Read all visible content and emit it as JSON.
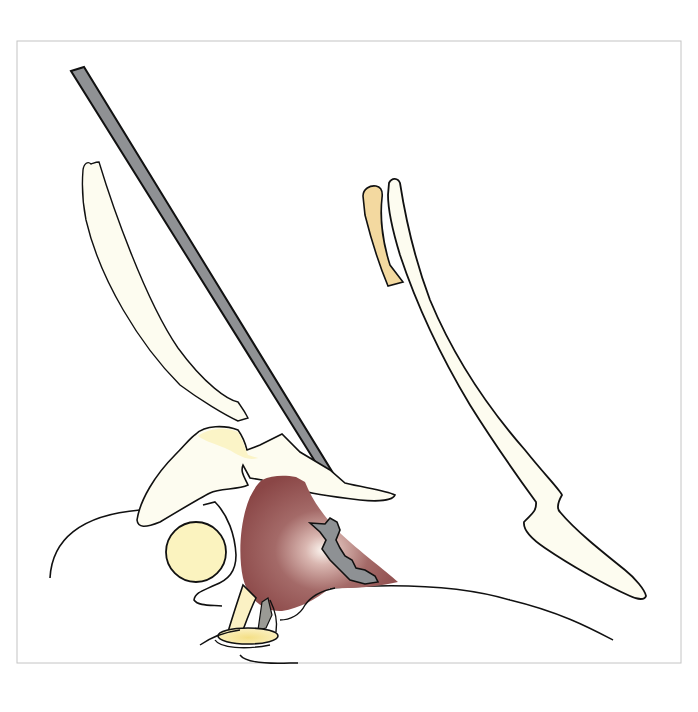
{
  "figure": {
    "type": "medical-illustration",
    "frame": {
      "x": 17,
      "y": 41,
      "width": 664,
      "height": 622,
      "stroke": "#bdbdbd"
    },
    "colors": {
      "outline": "#111111",
      "bone_fill": "#fdfcf0",
      "bone_yellow": "#fbf3c2",
      "cartilage_tan": "#f3d9a0",
      "needle_gray": "#8f9194",
      "mass_dark": "#8c4a4a",
      "mass_mid": "#a46a68",
      "mass_highlight": "#fbf4ee",
      "gray_region": "#8e9194",
      "circle_fill": "#fbf3bf",
      "pituitary_yellow": "#f6e49a"
    },
    "elements": [
      {
        "id": "needle",
        "label": "instrument-shaft"
      },
      {
        "id": "left-bone",
        "label": "anterior-bone-plate"
      },
      {
        "id": "right-bone",
        "label": "posterior-bone-strip"
      },
      {
        "id": "tan-strip",
        "label": "cartilage-strip"
      },
      {
        "id": "sphenoid",
        "label": "central-bone"
      },
      {
        "id": "mass",
        "label": "lesion"
      },
      {
        "id": "gray-region",
        "label": "lesion-core"
      },
      {
        "id": "circle",
        "label": "round-structure"
      },
      {
        "id": "stalk",
        "label": "stalk-structure"
      }
    ]
  }
}
